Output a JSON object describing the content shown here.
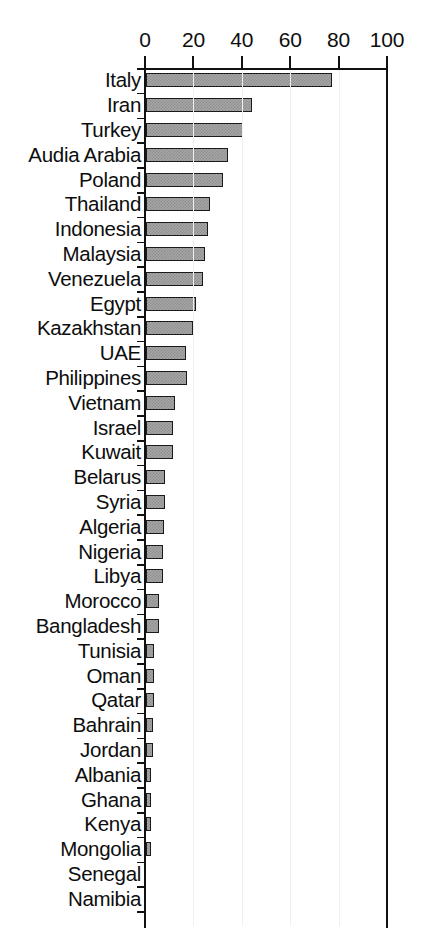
{
  "chart_data": {
    "type": "bar",
    "orientation": "horizontal",
    "title": "",
    "subtitle": "",
    "xlabel": "",
    "ylabel": "",
    "xlim": [
      0,
      100
    ],
    "ylim": [],
    "grid": false,
    "legend": null,
    "legend_position": "none",
    "xticks": [
      0,
      20,
      40,
      60,
      80,
      100
    ],
    "xtick_labels": [
      "0",
      "20",
      "40",
      "60",
      "80",
      "100"
    ],
    "categories": [
      "Italy",
      "Iran",
      "Turkey",
      "Audia Arabia",
      "Poland",
      "Thailand",
      "Indonesia",
      "Malaysia",
      "Venezuela",
      "Egypt",
      "Kazakhstan",
      "UAE",
      "Philippines",
      "Vietnam",
      "Israel",
      "Kuwait",
      "Belarus",
      "Syria",
      "Algeria",
      "Nigeria",
      "Libya",
      "Morocco",
      "Bangladesh",
      "Tunisia",
      "Oman",
      "Qatar",
      "Bahrain",
      "Jordan",
      "Albania",
      "Ghana",
      "Kenya",
      "Mongolia",
      "Senegal",
      "Namibia"
    ],
    "values": [
      77,
      44,
      40,
      34,
      32,
      26.5,
      25.5,
      24.5,
      23.5,
      20.5,
      19.5,
      16.5,
      17,
      12,
      11,
      11,
      8,
      8,
      7.5,
      7,
      7,
      5.5,
      5.5,
      3.5,
      3.5,
      3.5,
      3,
      3,
      2,
      2,
      2,
      2,
      0,
      0
    ],
    "bar_style": {
      "fill": "#a6a6a6",
      "pattern": "checker-dither",
      "edge": "#1b1b1b"
    }
  },
  "axis": {
    "line_color": "#111111",
    "background": "#ffffff"
  }
}
